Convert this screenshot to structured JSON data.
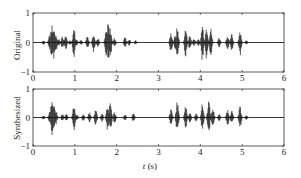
{
  "chart_data": [
    {
      "type": "line",
      "title": "",
      "ylabel": "Original",
      "xlabel": "",
      "xlim": [
        0,
        6
      ],
      "ylim": [
        -1,
        1
      ],
      "xticks": [
        0,
        1,
        2,
        3,
        4,
        5,
        6
      ],
      "yticks": [
        -1,
        0,
        1
      ],
      "grid": false,
      "envelope": [
        {
          "t": 0.25,
          "a": 0.08
        },
        {
          "t": 0.4,
          "a": 0.3
        },
        {
          "t": 0.45,
          "a": 0.6
        },
        {
          "t": 0.5,
          "a": 0.55
        },
        {
          "t": 0.55,
          "a": 0.3
        },
        {
          "t": 0.62,
          "a": 0.12
        },
        {
          "t": 0.7,
          "a": 0.2
        },
        {
          "t": 0.78,
          "a": 0.25
        },
        {
          "t": 0.88,
          "a": 0.08
        },
        {
          "t": 0.98,
          "a": 0.55
        },
        {
          "t": 1.05,
          "a": 0.1
        },
        {
          "t": 1.15,
          "a": 0.1
        },
        {
          "t": 1.3,
          "a": 0.25
        },
        {
          "t": 1.45,
          "a": 0.35
        },
        {
          "t": 1.55,
          "a": 0.15
        },
        {
          "t": 1.75,
          "a": 0.45
        },
        {
          "t": 1.8,
          "a": 0.7
        },
        {
          "t": 1.85,
          "a": 0.5
        },
        {
          "t": 1.95,
          "a": 0.15
        },
        {
          "t": 2.2,
          "a": 0.2
        },
        {
          "t": 2.3,
          "a": 0.12
        },
        {
          "t": 2.45,
          "a": 0.08
        },
        {
          "t": 3.3,
          "a": 0.35
        },
        {
          "t": 3.4,
          "a": 0.25
        },
        {
          "t": 3.45,
          "a": 0.55
        },
        {
          "t": 3.65,
          "a": 0.5
        },
        {
          "t": 3.75,
          "a": 0.25
        },
        {
          "t": 3.85,
          "a": 0.15
        },
        {
          "t": 3.95,
          "a": 0.12
        },
        {
          "t": 4.05,
          "a": 0.65
        },
        {
          "t": 4.15,
          "a": 0.6
        },
        {
          "t": 4.25,
          "a": 0.5
        },
        {
          "t": 4.45,
          "a": 0.18
        },
        {
          "t": 4.65,
          "a": 0.25
        },
        {
          "t": 4.75,
          "a": 0.3
        },
        {
          "t": 4.95,
          "a": 0.45
        },
        {
          "t": 5.1,
          "a": 0.08
        }
      ]
    },
    {
      "type": "line",
      "title": "",
      "ylabel": "Synthesized",
      "xlabel": "t (s)",
      "xlim": [
        0,
        6
      ],
      "ylim": [
        -1,
        1
      ],
      "xticks": [
        0,
        1,
        2,
        3,
        4,
        5,
        6
      ],
      "yticks": [
        -1,
        0,
        1
      ],
      "grid": false,
      "envelope": [
        {
          "t": 0.25,
          "a": 0.08
        },
        {
          "t": 0.4,
          "a": 0.2
        },
        {
          "t": 0.45,
          "a": 0.7
        },
        {
          "t": 0.5,
          "a": 0.5
        },
        {
          "t": 0.55,
          "a": 0.25
        },
        {
          "t": 0.7,
          "a": 0.12
        },
        {
          "t": 0.8,
          "a": 0.15
        },
        {
          "t": 0.98,
          "a": 0.55
        },
        {
          "t": 1.05,
          "a": 0.1
        },
        {
          "t": 1.2,
          "a": 0.12
        },
        {
          "t": 1.35,
          "a": 0.18
        },
        {
          "t": 1.5,
          "a": 0.3
        },
        {
          "t": 1.65,
          "a": 0.15
        },
        {
          "t": 1.78,
          "a": 0.45
        },
        {
          "t": 1.85,
          "a": 0.55
        },
        {
          "t": 1.95,
          "a": 0.2
        },
        {
          "t": 2.2,
          "a": 0.12
        },
        {
          "t": 2.4,
          "a": 0.15
        },
        {
          "t": 3.3,
          "a": 0.3
        },
        {
          "t": 3.45,
          "a": 0.6
        },
        {
          "t": 3.65,
          "a": 0.45
        },
        {
          "t": 3.75,
          "a": 0.2
        },
        {
          "t": 3.9,
          "a": 0.15
        },
        {
          "t": 4.05,
          "a": 0.5
        },
        {
          "t": 4.2,
          "a": 0.65
        },
        {
          "t": 4.3,
          "a": 0.35
        },
        {
          "t": 4.45,
          "a": 0.12
        },
        {
          "t": 4.65,
          "a": 0.3
        },
        {
          "t": 4.75,
          "a": 0.25
        },
        {
          "t": 4.95,
          "a": 0.4
        },
        {
          "t": 5.1,
          "a": 0.08
        }
      ]
    }
  ],
  "axis_labels": {
    "top_ylabel": "Original",
    "bottom_ylabel": "Synthesized",
    "xlabel": "t (s)"
  }
}
